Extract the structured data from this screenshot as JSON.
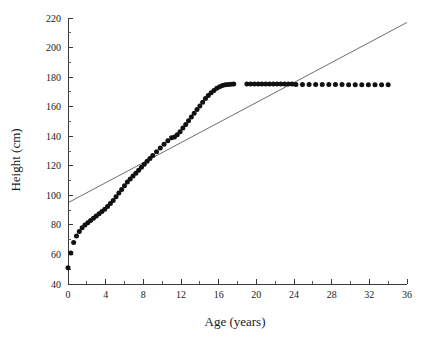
{
  "chart_data": {
    "type": "scatter",
    "title": "",
    "xlabel": "Age (years)",
    "ylabel": "Height (cm)",
    "xlim": [
      0,
      36
    ],
    "ylim": [
      40,
      220
    ],
    "xticks": [
      0,
      4,
      8,
      12,
      16,
      20,
      24,
      28,
      32,
      36
    ],
    "xtick_labels": [
      "0",
      "4",
      "8",
      "12",
      "16",
      "20",
      "24",
      "28",
      "32",
      "36"
    ],
    "xminor_step": 2,
    "yticks": [
      40,
      60,
      80,
      100,
      120,
      140,
      160,
      180,
      200,
      220
    ],
    "ytick_labels": [
      "40",
      "60",
      "80",
      "100",
      "120",
      "140",
      "160",
      "180",
      "200",
      "220"
    ],
    "grid": false,
    "legend": null,
    "marker": {
      "shape": "circle",
      "color": "#111111",
      "size_px": 5
    },
    "series": [
      {
        "name": "Height by age",
        "type": "scatter",
        "points": [
          [
            0.0,
            51.0
          ],
          [
            0.3,
            61.0
          ],
          [
            0.6,
            68.0
          ],
          [
            0.9,
            72.5
          ],
          [
            1.2,
            75.5
          ],
          [
            1.5,
            78.0
          ],
          [
            1.8,
            80.0
          ],
          [
            2.1,
            81.5
          ],
          [
            2.4,
            83.0
          ],
          [
            2.7,
            84.5
          ],
          [
            3.0,
            86.0
          ],
          [
            3.3,
            87.5
          ],
          [
            3.6,
            89.0
          ],
          [
            3.9,
            90.5
          ],
          [
            4.2,
            92.5
          ],
          [
            4.5,
            94.5
          ],
          [
            4.8,
            96.5
          ],
          [
            5.1,
            99.0
          ],
          [
            5.4,
            101.5
          ],
          [
            5.7,
            104.0
          ],
          [
            6.0,
            106.5
          ],
          [
            6.3,
            109.0
          ],
          [
            6.6,
            111.0
          ],
          [
            6.9,
            113.0
          ],
          [
            7.2,
            115.0
          ],
          [
            7.5,
            117.0
          ],
          [
            7.8,
            119.0
          ],
          [
            8.1,
            121.0
          ],
          [
            8.4,
            123.0
          ],
          [
            8.7,
            125.0
          ],
          [
            9.0,
            127.0
          ],
          [
            9.4,
            129.5
          ],
          [
            9.8,
            132.0
          ],
          [
            10.2,
            134.5
          ],
          [
            10.6,
            137.0
          ],
          [
            11.0,
            139.0
          ],
          [
            11.3,
            139.5
          ],
          [
            11.6,
            141.0
          ],
          [
            11.9,
            143.0
          ],
          [
            12.2,
            145.5
          ],
          [
            12.5,
            148.0
          ],
          [
            12.8,
            150.5
          ],
          [
            13.1,
            153.0
          ],
          [
            13.4,
            155.5
          ],
          [
            13.7,
            158.0
          ],
          [
            14.0,
            160.5
          ],
          [
            14.3,
            163.0
          ],
          [
            14.6,
            165.5
          ],
          [
            14.9,
            167.5
          ],
          [
            15.2,
            169.5
          ],
          [
            15.5,
            171.0
          ],
          [
            15.8,
            172.5
          ],
          [
            16.1,
            173.5
          ],
          [
            16.4,
            174.3
          ],
          [
            16.7,
            174.8
          ],
          [
            17.0,
            175.0
          ],
          [
            17.3,
            175.2
          ],
          [
            17.6,
            175.3
          ],
          [
            19.0,
            175.3
          ],
          [
            19.4,
            175.3
          ],
          [
            19.8,
            175.3
          ],
          [
            20.2,
            175.3
          ],
          [
            20.6,
            175.3
          ],
          [
            21.0,
            175.3
          ],
          [
            21.4,
            175.3
          ],
          [
            21.8,
            175.3
          ],
          [
            22.2,
            175.3
          ],
          [
            22.6,
            175.3
          ],
          [
            23.0,
            175.3
          ],
          [
            23.4,
            175.3
          ],
          [
            23.8,
            175.3
          ],
          [
            24.2,
            175.0
          ],
          [
            24.9,
            175.0
          ],
          [
            25.6,
            175.0
          ],
          [
            26.3,
            175.0
          ],
          [
            27.0,
            175.0
          ],
          [
            27.7,
            175.0
          ],
          [
            28.4,
            175.0
          ],
          [
            29.1,
            175.0
          ],
          [
            29.8,
            174.8
          ],
          [
            30.5,
            174.8
          ],
          [
            31.2,
            174.8
          ],
          [
            31.9,
            174.8
          ],
          [
            32.6,
            174.8
          ],
          [
            33.3,
            174.8
          ],
          [
            34.0,
            174.8
          ]
        ]
      },
      {
        "name": "Reference line",
        "type": "line",
        "color": "#5c5c5c",
        "points": [
          [
            0.0,
            95.0
          ],
          [
            36.0,
            217.0
          ]
        ]
      }
    ]
  }
}
